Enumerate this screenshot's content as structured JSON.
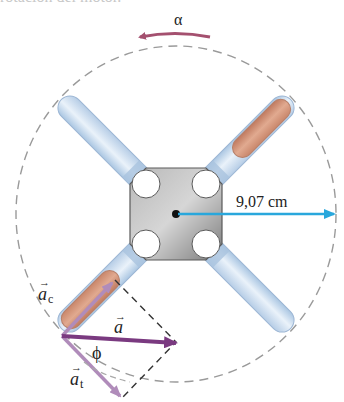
{
  "caption": {
    "text": "rotación del motor."
  },
  "labels": {
    "alpha": "α",
    "radius": "9,07 cm",
    "a_c": "a",
    "a_c_sub": "c",
    "a": "a",
    "a_t": "a",
    "a_t_sub": "t",
    "phi": "ϕ"
  },
  "colors": {
    "alpha_arrow": "#a4506f",
    "radius_arrow": "#29a7dc",
    "a_vector": "#7a3a80",
    "component_vectors": "#b08cba",
    "dashed_circle": "#9a9a9a",
    "hub": "#8a8a8a",
    "tube_blue": "#cfe0f0",
    "tube_copper": "#d59a80"
  }
}
